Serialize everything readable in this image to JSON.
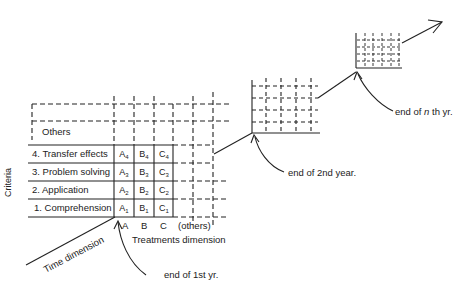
{
  "axes": {
    "criteria_label": "Criteria",
    "treatments_label": "Treatments dimension",
    "time_label": "Time dimension"
  },
  "criteria_rows": [
    {
      "label": "Others"
    },
    {
      "label": "4. Transfer effects"
    },
    {
      "label": "3. Problem solving"
    },
    {
      "label": "2. Application"
    },
    {
      "label": "1. Comprehension"
    }
  ],
  "treatment_columns": [
    "A",
    "B",
    "C",
    "(others)"
  ],
  "cells": [
    [
      {
        "letter": "A",
        "sub": "4"
      },
      {
        "letter": "B",
        "sub": "4"
      },
      {
        "letter": "C",
        "sub": "4"
      }
    ],
    [
      {
        "letter": "A",
        "sub": "3"
      },
      {
        "letter": "B",
        "sub": "3"
      },
      {
        "letter": "C",
        "sub": "3"
      }
    ],
    [
      {
        "letter": "A",
        "sub": "2"
      },
      {
        "letter": "B",
        "sub": "2"
      },
      {
        "letter": "C",
        "sub": "2"
      }
    ],
    [
      {
        "letter": "A",
        "sub": "1"
      },
      {
        "letter": "B",
        "sub": "1"
      },
      {
        "letter": "C",
        "sub": "1"
      }
    ]
  ],
  "annotations": {
    "end_1st": "end of 1st yr.",
    "end_2nd": "end of 2nd year.",
    "end_nth_prefix": "end of ",
    "end_nth_n": "n",
    "end_nth_suffix": " th yr."
  },
  "colors": {
    "ink": "#222222",
    "background": "#ffffff"
  }
}
